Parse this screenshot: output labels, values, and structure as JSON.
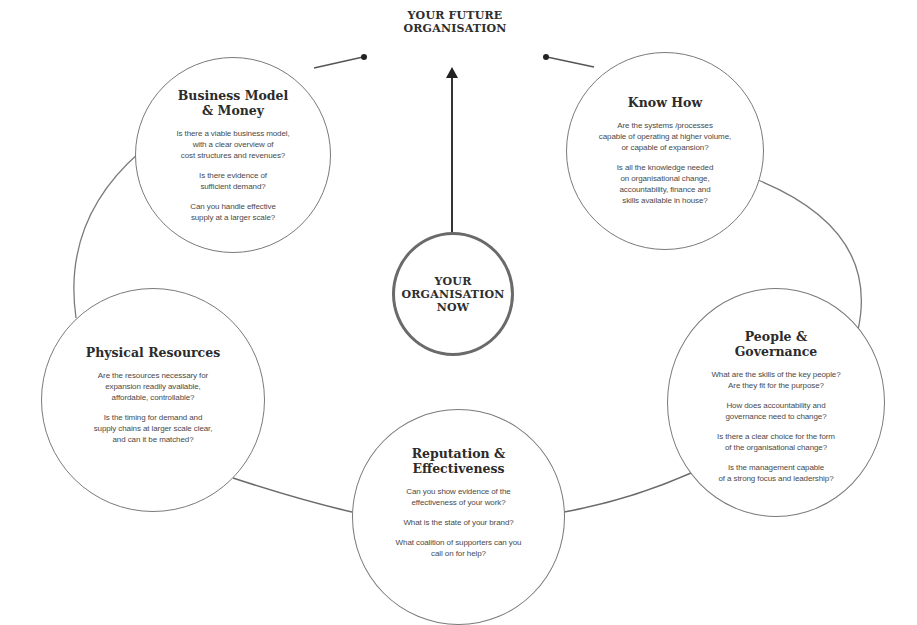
{
  "diagram": {
    "future": {
      "label": "YOUR FUTURE\nORGANISATION"
    },
    "center": {
      "label": "YOUR\nORGANISATION\nNOW"
    },
    "nodes": [
      {
        "id": "business-model",
        "title": "Business Model\n& Money",
        "questions": [
          "Is there a viable business model,\nwith a clear overview of\ncost structures and revenues?",
          "Is there evidence of\nsufficient demand?",
          "Can you handle effective\nsupply at a larger scale?"
        ]
      },
      {
        "id": "know-how",
        "title": "Know How",
        "questions": [
          "Are the systems /processes\ncapable of operating at higher volume,\nor capable of expansion?",
          "Is all the knowledge needed\non organisational change,\naccountability, finance and\nskills available in house?"
        ]
      },
      {
        "id": "physical-resources",
        "title": "Physical Resources",
        "questions": [
          "Are the resources necessary for\nexpansion readily available,\naffordable, controllable?",
          "Is the timing for demand and\nsupply chains at larger scale clear,\nand can it be matched?"
        ]
      },
      {
        "id": "people-governance",
        "title": "People &\nGovernance",
        "questions": [
          "What are the skills of the key people?\nAre they fit for the purpose?",
          "How does accountability and\ngovernance need to change?",
          "Is there a clear choice for the form\nof the organisational change?",
          "Is the management capable\nof a strong focus and leadership?"
        ]
      },
      {
        "id": "reputation",
        "title": "Reputation &\nEffectiveness",
        "questions": [
          "Can you show evidence of the\neffectiveness of your work?",
          "What is the state of your brand?",
          "What coalition of supporters can you\ncall on for help?"
        ]
      }
    ],
    "colors": {
      "line": "#6f6f6f",
      "text_dark": "#2b2b2b",
      "text_body": "#4a4a4a",
      "background": "#ffffff"
    }
  }
}
